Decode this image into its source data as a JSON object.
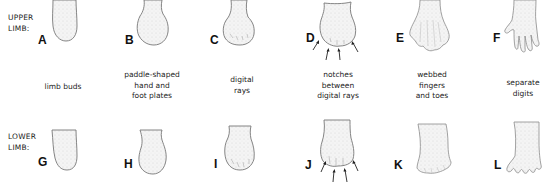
{
  "figure": {
    "rows": [
      {
        "id": "upper",
        "label_line1": "UPPER",
        "label_line2": "LIMB:"
      },
      {
        "id": "lower",
        "label_line1": "LOWER",
        "label_line2": "LIMB:"
      }
    ],
    "upper_panels": [
      {
        "letter": "A",
        "stage": "limb-bud"
      },
      {
        "letter": "B",
        "stage": "paddle"
      },
      {
        "letter": "C",
        "stage": "digital-rays"
      },
      {
        "letter": "D",
        "stage": "notches"
      },
      {
        "letter": "E",
        "stage": "webbed"
      },
      {
        "letter": "F",
        "stage": "separate-digits"
      }
    ],
    "lower_panels": [
      {
        "letter": "G",
        "stage": "limb-bud"
      },
      {
        "letter": "H",
        "stage": "paddle"
      },
      {
        "letter": "I",
        "stage": "digital-rays"
      },
      {
        "letter": "J",
        "stage": "notches"
      },
      {
        "letter": "K",
        "stage": "webbed"
      },
      {
        "letter": "L",
        "stage": "separate-digits"
      }
    ],
    "captions": [
      {
        "lines": [
          "limb buds"
        ]
      },
      {
        "lines": [
          "paddle-shaped",
          "hand and",
          "foot plates"
        ]
      },
      {
        "lines": [
          "digital",
          "rays"
        ]
      },
      {
        "lines": [
          "notches",
          "between",
          "digital rays"
        ]
      },
      {
        "lines": [
          "webbed",
          "fingers",
          "and toes"
        ]
      },
      {
        "lines": [
          "separate",
          "digits"
        ]
      }
    ],
    "colors": {
      "background": "#ffffff",
      "outline": "#777777",
      "text": "#222222"
    }
  }
}
